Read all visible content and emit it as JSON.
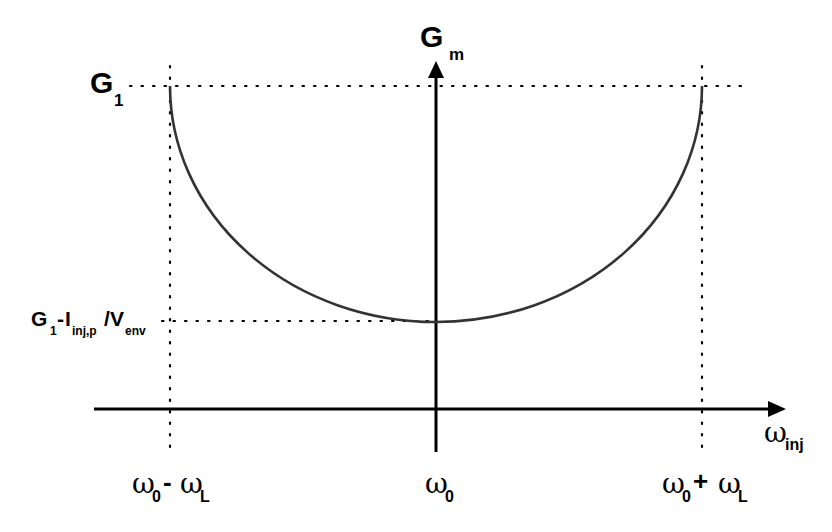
{
  "diagram": {
    "colors": {
      "axis": "#000000",
      "curve": "#333333",
      "guides": "#000000",
      "background": "#ffffff"
    },
    "y_axis": {
      "label_main": "G",
      "label_sub": "m"
    },
    "x_axis": {
      "label_main": "ω",
      "label_sub": "inj"
    },
    "y_labels": {
      "g1": {
        "main": "G",
        "sub": "1"
      },
      "gmin": {
        "g": "G",
        "g_sub": "1",
        "dash": "-",
        "i": "I",
        "i_sub": "inj,p",
        "slash": "/",
        "v": "V",
        "v_sub": "env"
      }
    },
    "x_labels": {
      "left": {
        "w0": "ω",
        "w0_sub": "0",
        "op": "-",
        "wl": "ω",
        "wl_sub": "L"
      },
      "center": {
        "w0": "ω",
        "w0_sub": "0"
      },
      "right": {
        "w0": "ω",
        "w0_sub": "0",
        "op": "+",
        "wl": "ω",
        "wl_sub": "L"
      }
    },
    "curve": {
      "shape": "semi-ellipse (U-shaped)",
      "left_point": "ω0 - ωL, G1",
      "min_point": "ω0, G1 - Iinj,p/Venv",
      "right_point": "ω0 + ωL, G1"
    }
  }
}
